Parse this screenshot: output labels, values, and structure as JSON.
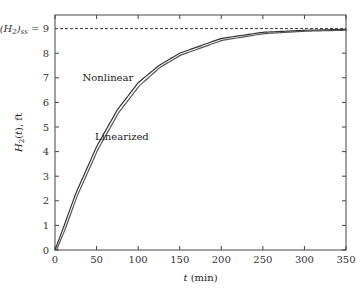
{
  "chart_data": {
    "type": "line",
    "title": "",
    "xlabel": "t (min)",
    "ylabel": "H2(t), ft",
    "xlim": [
      0,
      350
    ],
    "ylim": [
      0,
      9.2
    ],
    "xticks": [
      0,
      50,
      100,
      150,
      200,
      250,
      300,
      350
    ],
    "yticks": [
      0,
      1,
      2,
      3,
      4,
      5,
      6,
      7,
      8
    ],
    "steady_state": {
      "label": "(H2)ss = 9",
      "value": 9
    },
    "annotations": [
      {
        "text": "Nonlinear",
        "x": 50,
        "y": 7
      },
      {
        "text": "Linearized",
        "x": 65,
        "y": 4.6
      }
    ],
    "series": [
      {
        "name": "Nonlinear",
        "x": [
          0,
          10,
          25,
          50,
          75,
          100,
          125,
          150,
          200,
          250,
          300,
          350
        ],
        "values": [
          0,
          0.9,
          2.3,
          4.2,
          5.7,
          6.8,
          7.5,
          8.0,
          8.6,
          8.85,
          8.93,
          8.97
        ]
      },
      {
        "name": "Linearized",
        "x": [
          0,
          10,
          25,
          50,
          75,
          100,
          125,
          150,
          200,
          250,
          300,
          350
        ],
        "values": [
          0,
          0.8,
          2.2,
          4.1,
          5.6,
          6.7,
          7.45,
          7.95,
          8.55,
          8.82,
          8.92,
          8.96
        ]
      }
    ]
  }
}
